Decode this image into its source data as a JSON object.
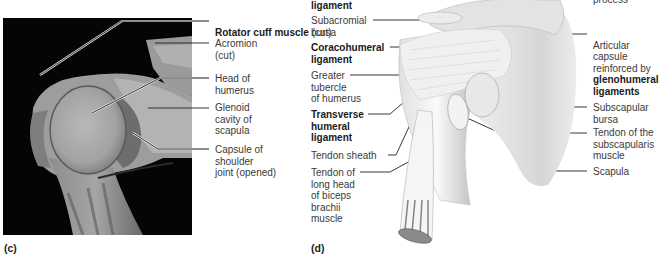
{
  "panel_c": {
    "label": "(c)",
    "labels": [
      {
        "id": "rotator-cuff",
        "bold": "Rotator cuff muscle",
        "normal": " (cut)"
      },
      {
        "id": "acromion",
        "text": "Acromion\n(cut)"
      },
      {
        "id": "head-humerus",
        "text": "Head of\nhumerus"
      },
      {
        "id": "glenoid",
        "text": "Glenoid\ncavity of\nscapula"
      },
      {
        "id": "capsule",
        "text": "Capsule of\nshoulder\njoint (opened)"
      }
    ]
  },
  "panel_d": {
    "label": "(d)",
    "left_labels": [
      {
        "id": "top-ligament",
        "bold": "ligament"
      },
      {
        "id": "subacromial-bursa",
        "text": "Subacromial\nbursa"
      },
      {
        "id": "coracohumeral",
        "bold": "Coracohumeral\nligament"
      },
      {
        "id": "greater-tubercle",
        "text": "Greater\ntubercle\nof humerus"
      },
      {
        "id": "transverse-humeral",
        "bold": "Transverse\nhumeral\nligament"
      },
      {
        "id": "tendon-sheath",
        "text": "Tendon sheath"
      },
      {
        "id": "tendon-biceps",
        "text": "Tendon of\nlong head\nof biceps\nbrachii\nmuscle"
      }
    ],
    "right_labels": [
      {
        "id": "process",
        "text": "process"
      },
      {
        "id": "articular-capsule",
        "text": "Articular\ncapsule\nreinforced by",
        "bold": "glenohumeral\nligaments"
      },
      {
        "id": "subscapular-bursa",
        "text": "Subscapular\nbursa"
      },
      {
        "id": "tendon-subscapularis",
        "text": "Tendon of the\nsubscapularis\nmuscle"
      },
      {
        "id": "scapula",
        "text": "Scapula"
      }
    ]
  },
  "colors": {
    "photo_bg": "#050505",
    "leader_line": "#231f20",
    "text": "#3a3a3a"
  }
}
